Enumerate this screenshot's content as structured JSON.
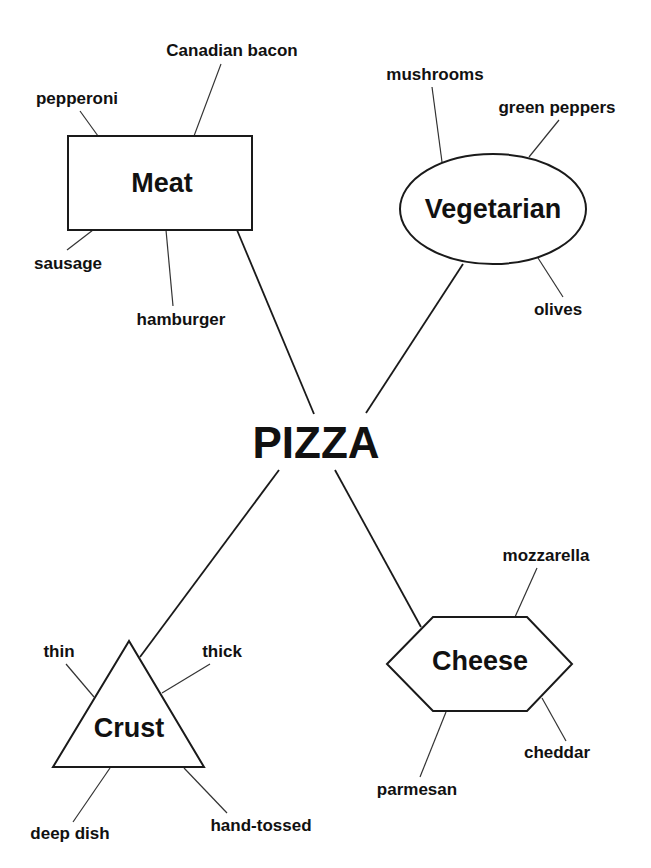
{
  "diagram": {
    "center": {
      "label": "PIZZA",
      "x": 316,
      "y": 458
    },
    "categories": [
      {
        "id": "meat",
        "label": "Meat",
        "shape": "rectangle",
        "x": 162,
        "y": 192,
        "items": [
          {
            "label": "pepperoni",
            "x": 77,
            "y": 104
          },
          {
            "label": "Canadian bacon",
            "x": 232,
            "y": 56
          },
          {
            "label": "sausage",
            "x": 68,
            "y": 269
          },
          {
            "label": "hamburger",
            "x": 181,
            "y": 325
          }
        ]
      },
      {
        "id": "vegetarian",
        "label": "Vegetarian",
        "shape": "ellipse",
        "x": 493,
        "y": 218,
        "items": [
          {
            "label": "mushrooms",
            "x": 435,
            "y": 80
          },
          {
            "label": "green peppers",
            "x": 557,
            "y": 113
          },
          {
            "label": "olives",
            "x": 558,
            "y": 315
          }
        ]
      },
      {
        "id": "crust",
        "label": "Crust",
        "shape": "triangle",
        "x": 129,
        "y": 737,
        "items": [
          {
            "label": "thin",
            "x": 59,
            "y": 657
          },
          {
            "label": "thick",
            "x": 222,
            "y": 657
          },
          {
            "label": "deep dish",
            "x": 70,
            "y": 839
          },
          {
            "label": "hand-tossed",
            "x": 261,
            "y": 831
          }
        ]
      },
      {
        "id": "cheese",
        "label": "Cheese",
        "shape": "hexagon",
        "x": 480,
        "y": 670,
        "items": [
          {
            "label": "mozzarella",
            "x": 546,
            "y": 561
          },
          {
            "label": "cheddar",
            "x": 557,
            "y": 758
          },
          {
            "label": "parmesan",
            "x": 417,
            "y": 795
          }
        ]
      }
    ]
  }
}
